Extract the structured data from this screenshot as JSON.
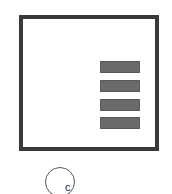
{
  "diagram": {
    "frame": {
      "shape": "square",
      "border_color": "#3a3a3a",
      "fill": "#ffffff"
    },
    "bars": [
      {
        "index": 1,
        "color": "#6a6a6a"
      },
      {
        "index": 2,
        "color": "#6a6a6a"
      },
      {
        "index": 3,
        "color": "#6a6a6a"
      },
      {
        "index": 4,
        "color": "#6a6a6a"
      }
    ],
    "label": {
      "text": "c",
      "shape": "circle"
    }
  }
}
